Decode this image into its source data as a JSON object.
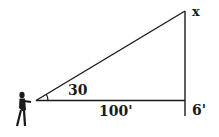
{
  "diagram": {
    "type": "right-triangle-elevation-problem",
    "labels": {
      "angle": "30",
      "base_distance": "100'",
      "unknown_height": "x",
      "observer_eye_height": "6'"
    },
    "elements": [
      "observer-figure",
      "line-of-sight",
      "horizontal-baseline",
      "vertical-object",
      "angle-arc"
    ],
    "colors": {
      "stroke": "#1a1a1a",
      "background": "#ffffff"
    }
  }
}
